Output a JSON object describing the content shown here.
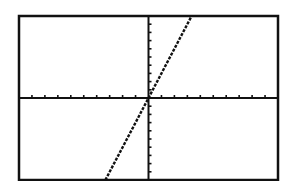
{
  "chart_data": {
    "type": "line",
    "title": "",
    "xlabel": "",
    "ylabel": "",
    "xlim": [
      -10,
      10
    ],
    "ylim": [
      -10,
      10
    ],
    "xscale": 1,
    "yscale": 1,
    "grid": false,
    "axes_through_origin": true,
    "series": [
      {
        "name": "y = 3x",
        "equation": "y=3x",
        "slope": 3,
        "intercept": 0,
        "x": [
          -3.33,
          0,
          3.33
        ],
        "y": [
          -10,
          0,
          10
        ],
        "style": "dotted-pixel"
      }
    ]
  },
  "colors": {
    "background": "#ffffff",
    "frame": "#111111",
    "axes": "#111111",
    "line": "#111111"
  },
  "layout": {
    "frame": {
      "left": 19,
      "top": 16,
      "right": 278,
      "bottom": 180
    }
  }
}
